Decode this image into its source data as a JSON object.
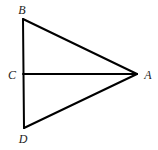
{
  "diagram": {
    "type": "geometry",
    "stroke_color": "#000000",
    "label_color": "#222222",
    "points": {
      "B": {
        "label": "B",
        "x": 23,
        "y": 19,
        "label_x": 22,
        "label_y": 14
      },
      "C": {
        "label": "C",
        "x": 23,
        "y": 74,
        "label_x": 12,
        "label_y": 79
      },
      "A": {
        "label": "A",
        "x": 137,
        "y": 74,
        "label_x": 148,
        "label_y": 79
      },
      "D": {
        "label": "D",
        "x": 24,
        "y": 128,
        "label_x": 23,
        "label_y": 143
      }
    },
    "segments": [
      {
        "from": "B",
        "to": "D"
      },
      {
        "from": "B",
        "to": "A"
      },
      {
        "from": "D",
        "to": "A"
      },
      {
        "from": "C",
        "to": "A"
      }
    ]
  }
}
